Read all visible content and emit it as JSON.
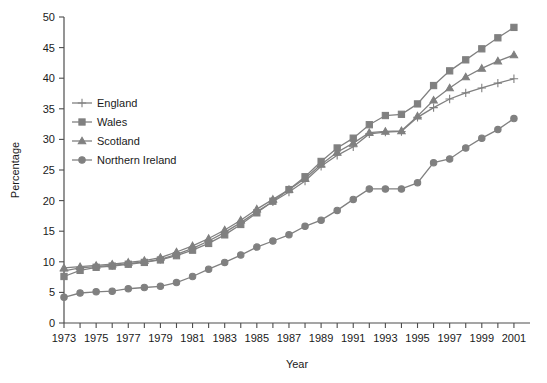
{
  "chart_data": {
    "type": "line",
    "title": "",
    "xlabel": "Year",
    "ylabel": "Percentage",
    "xlim": [
      1973,
      2002
    ],
    "ylim": [
      0,
      50
    ],
    "ytick_step": 5,
    "xtick_step": 1,
    "xtick_label_step": 2,
    "grid": false,
    "legend_position": "upper-left-inside",
    "line_color": "#808080",
    "axis_color": "#4d4d4d",
    "background": "#ffffff",
    "x": [
      1973,
      1974,
      1975,
      1976,
      1977,
      1978,
      1979,
      1980,
      1981,
      1982,
      1983,
      1984,
      1985,
      1986,
      1987,
      1988,
      1989,
      1990,
      1991,
      1992,
      1993,
      1994,
      1995,
      1996,
      1997,
      1998,
      1999,
      2000,
      2001
    ],
    "xtick_labels": [
      "1973",
      "1975",
      "1977",
      "1979",
      "1981",
      "1983",
      "1985",
      "1987",
      "1989",
      "1991",
      "1993",
      "1995",
      "1997",
      "1999",
      "2001"
    ],
    "ytick_labels": [
      "0",
      "5",
      "10",
      "15",
      "20",
      "25",
      "30",
      "35",
      "40",
      "45",
      "50"
    ],
    "series": [
      {
        "name": "England",
        "marker": "plus",
        "values": [
          8.5,
          9.0,
          9.2,
          9.4,
          9.7,
          10.0,
          10.4,
          11.2,
          12.2,
          13.4,
          14.8,
          16.4,
          18.2,
          19.8,
          21.4,
          23.2,
          25.6,
          27.4,
          28.8,
          30.9,
          31.2,
          31.3,
          33.6,
          35.2,
          36.6,
          37.6,
          38.4,
          39.2,
          39.9
        ]
      },
      {
        "name": "Wales",
        "marker": "square",
        "values": [
          7.6,
          8.6,
          9.1,
          9.3,
          9.6,
          9.9,
          10.3,
          11.0,
          11.9,
          13.0,
          14.4,
          16.1,
          18.0,
          19.9,
          21.8,
          23.9,
          26.4,
          28.6,
          30.2,
          32.4,
          33.9,
          34.1,
          35.8,
          38.8,
          41.2,
          43.0,
          44.8,
          46.6,
          48.3
        ]
      },
      {
        "name": "Scotland",
        "marker": "triangle",
        "values": [
          9.0,
          9.2,
          9.4,
          9.6,
          9.9,
          10.2,
          10.7,
          11.6,
          12.6,
          13.8,
          15.2,
          16.8,
          18.6,
          20.2,
          21.8,
          23.6,
          25.9,
          27.9,
          29.4,
          31.1,
          31.3,
          31.4,
          33.8,
          36.4,
          38.4,
          40.2,
          41.6,
          42.8,
          43.8
        ]
      },
      {
        "name": "Northern Ireland",
        "marker": "circle",
        "values": [
          4.2,
          4.9,
          5.1,
          5.2,
          5.6,
          5.8,
          6.0,
          6.6,
          7.6,
          8.8,
          9.9,
          11.1,
          12.4,
          13.4,
          14.4,
          15.8,
          16.8,
          18.4,
          20.2,
          21.9,
          21.9,
          21.9,
          22.9,
          26.2,
          26.8,
          28.6,
          30.2,
          31.6,
          33.4
        ]
      }
    ]
  },
  "legend": {
    "entries": [
      {
        "label": "England"
      },
      {
        "label": "Wales"
      },
      {
        "label": "Scotland"
      },
      {
        "label": "Northern Ireland"
      }
    ]
  }
}
